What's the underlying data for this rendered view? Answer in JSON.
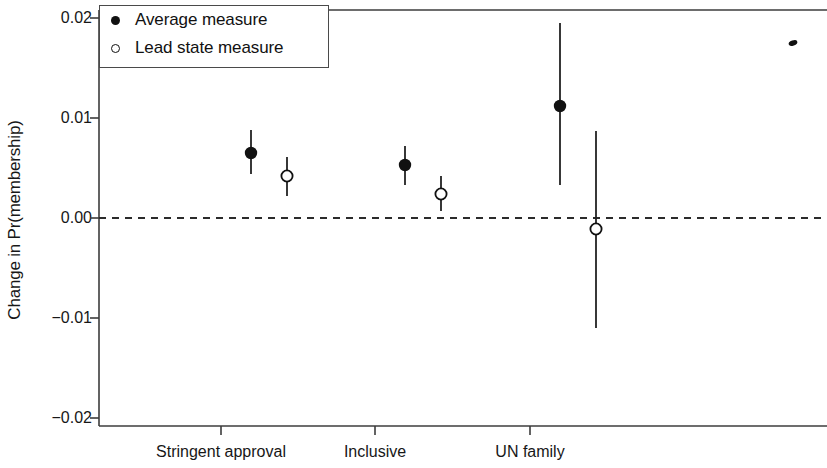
{
  "chart_data": {
    "type": "scatter",
    "title": "",
    "subtitle": "",
    "xlabel": "",
    "ylabel": "Change in Pr(membership)",
    "categories": [
      "Stringent approval",
      "Inclusive",
      "UN family"
    ],
    "ylim": [
      -0.02,
      0.02
    ],
    "ytick_labels": [
      "0.02",
      "0.01",
      "0.00",
      "-0.01",
      "-0.02"
    ],
    "ytick_values": [
      0.02,
      0.01,
      0.0,
      -0.01,
      -0.02
    ],
    "grid": false,
    "zero_reference_line": {
      "value": 0.0,
      "style": "dashed"
    },
    "legend": {
      "position": "top-left",
      "entries": [
        {
          "label": "Average measure",
          "marker": "filled-circle"
        },
        {
          "label": "Lead state measure",
          "marker": "open-circle"
        }
      ]
    },
    "series": [
      {
        "name": "Average measure",
        "marker": "filled-circle",
        "points": [
          {
            "category": "Stringent approval",
            "value": 0.0065,
            "ci_low": 0.0044,
            "ci_high": 0.0088
          },
          {
            "category": "Inclusive",
            "value": 0.0053,
            "ci_low": 0.0033,
            "ci_high": 0.0072
          },
          {
            "category": "UN family",
            "value": 0.0112,
            "ci_low": 0.0033,
            "ci_high": 0.0195
          }
        ]
      },
      {
        "name": "Lead state measure",
        "marker": "open-circle",
        "points": [
          {
            "category": "Stringent approval",
            "value": 0.0042,
            "ci_low": 0.0022,
            "ci_high": 0.0061
          },
          {
            "category": "Inclusive",
            "value": 0.0024,
            "ci_low": 0.0007,
            "ci_high": 0.0042
          },
          {
            "category": "UN family",
            "value": -0.0011,
            "ci_low": -0.011,
            "ci_high": 0.0087
          }
        ]
      }
    ],
    "annotations": [
      {
        "name": "stray-mark",
        "x_px": 793,
        "y_px": 43
      }
    ]
  }
}
